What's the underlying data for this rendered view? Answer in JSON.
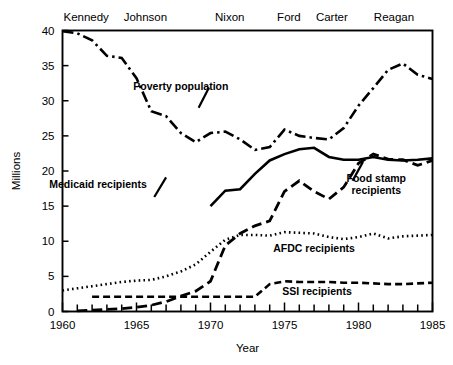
{
  "chart_data": {
    "type": "line",
    "title": "",
    "xlabel": "Year",
    "ylabel": "Millions",
    "xlim": [
      1960,
      1985
    ],
    "ylim": [
      0,
      40
    ],
    "grid": false,
    "legend_position": "inline-annotations",
    "x_ticks": [
      1960,
      1965,
      1970,
      1975,
      1980,
      1985
    ],
    "x_tick_labels": [
      "1960",
      "1965",
      "1970",
      "1975",
      "1980",
      "1985"
    ],
    "x_minor_tick_interval": 1,
    "y_ticks": [
      0,
      5,
      10,
      15,
      20,
      25,
      30,
      35,
      40
    ],
    "y_tick_labels": [
      "0",
      "5",
      "10",
      "15",
      "20",
      "25",
      "30",
      "35",
      "40"
    ],
    "annotations": [
      {
        "name": "president-kennedy",
        "text": "Kennedy",
        "x": 1961.6,
        "position": "top"
      },
      {
        "name": "president-johnson",
        "text": "Johnson",
        "x": 1965.6,
        "position": "top"
      },
      {
        "name": "president-nixon",
        "text": "Nixon",
        "x": 1971.3,
        "position": "top"
      },
      {
        "name": "president-ford",
        "text": "Ford",
        "x": 1975.3,
        "position": "top"
      },
      {
        "name": "president-carter",
        "text": "Carter",
        "x": 1978.2,
        "position": "top"
      },
      {
        "name": "president-reagan",
        "text": "Reagan",
        "x": 1982.4,
        "position": "top"
      }
    ],
    "series": [
      {
        "name": "Poverty population",
        "label": "Poverty population",
        "style": "dash-dot",
        "label_x": 1968.0,
        "label_y": 31.6,
        "x": [
          1960,
          1961,
          1962,
          1963,
          1964,
          1965,
          1966,
          1967,
          1968,
          1969,
          1970,
          1971,
          1972,
          1973,
          1974,
          1975,
          1976,
          1977,
          1978,
          1979,
          1980,
          1981,
          1982,
          1983,
          1984,
          1985
        ],
        "values": [
          39.9,
          39.6,
          38.6,
          36.4,
          36.1,
          33.2,
          28.5,
          27.8,
          25.4,
          24.1,
          25.4,
          25.6,
          24.5,
          23.0,
          23.4,
          25.9,
          25.0,
          24.7,
          24.5,
          26.1,
          29.3,
          31.8,
          34.4,
          35.3,
          33.7,
          33.1
        ]
      },
      {
        "name": "Medicaid recipients",
        "label": "Medicaid recipients",
        "style": "solid",
        "label_x": 1962.4,
        "label_y": 17.6,
        "x": [
          1970,
          1971,
          1972,
          1973,
          1974,
          1975,
          1976,
          1977,
          1978,
          1979,
          1980,
          1981,
          1982,
          1983,
          1984,
          1985
        ],
        "values": [
          15.0,
          17.2,
          17.4,
          19.6,
          21.5,
          22.4,
          23.1,
          23.3,
          22.0,
          21.6,
          21.6,
          22.0,
          21.6,
          21.5,
          21.6,
          21.8
        ]
      },
      {
        "name": "Food stamp recipients",
        "label": "Food stamp\nrecipients",
        "label_line1": "Food stamp",
        "label_line2": "recipients",
        "style": "long-dash",
        "label_x": 1981.2,
        "label_y": 18.4,
        "x": [
          1961,
          1962,
          1963,
          1964,
          1965,
          1966,
          1967,
          1968,
          1969,
          1970,
          1971,
          1972,
          1973,
          1974,
          1975,
          1976,
          1977,
          1978,
          1979,
          1980,
          1981,
          1982,
          1983,
          1984,
          1985
        ],
        "values": [
          0.1,
          0.2,
          0.3,
          0.4,
          0.6,
          0.9,
          1.4,
          2.2,
          2.9,
          4.3,
          9.4,
          11.1,
          12.2,
          12.9,
          17.1,
          18.6,
          17.1,
          16.0,
          17.7,
          21.1,
          22.4,
          21.7,
          21.6,
          20.8,
          21.5
        ]
      },
      {
        "name": "AFDC recipients",
        "label": "AFDC recipients",
        "style": "dotted",
        "label_x": 1977.0,
        "label_y": 8.5,
        "x": [
          1960,
          1961,
          1962,
          1963,
          1964,
          1965,
          1966,
          1967,
          1968,
          1969,
          1970,
          1971,
          1972,
          1973,
          1974,
          1975,
          1976,
          1977,
          1978,
          1979,
          1980,
          1981,
          1982,
          1983,
          1984,
          1985
        ],
        "values": [
          3.0,
          3.3,
          3.6,
          3.9,
          4.2,
          4.4,
          4.5,
          5.0,
          5.7,
          6.7,
          8.5,
          10.2,
          10.9,
          10.9,
          10.8,
          11.3,
          11.2,
          11.1,
          10.6,
          10.3,
          10.6,
          11.1,
          10.4,
          10.7,
          10.8,
          10.9
        ]
      },
      {
        "name": "SSI recipients",
        "label": "SSI recipients",
        "style": "dash",
        "label_x": 1977.2,
        "label_y": 2.3,
        "x": [
          1962,
          1963,
          1964,
          1965,
          1966,
          1967,
          1968,
          1969,
          1970,
          1971,
          1972,
          1973,
          1974,
          1975,
          1976,
          1977,
          1978,
          1979,
          1980,
          1981,
          1982,
          1983,
          1984,
          1985
        ],
        "values": [
          2.1,
          2.1,
          2.1,
          2.1,
          2.1,
          2.1,
          2.1,
          2.1,
          2.1,
          2.1,
          2.1,
          2.1,
          3.9,
          4.3,
          4.2,
          4.2,
          4.2,
          4.1,
          4.1,
          4.0,
          3.9,
          3.9,
          4.0,
          4.1
        ]
      }
    ]
  }
}
